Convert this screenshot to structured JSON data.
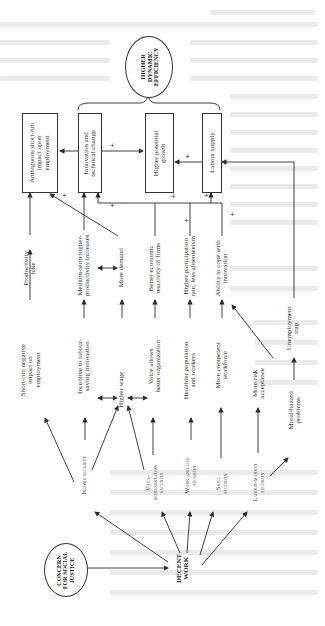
{
  "page": {
    "orientation": "rotated-90-ccw",
    "background": "#ffffff",
    "ink": "#2a2a2a"
  },
  "diagram": {
    "title_ellipse": {
      "id": "higher-dynamic-efficiency",
      "lines": [
        "HIGHER",
        "DYNAMIC",
        "EFFICIENCY"
      ]
    },
    "source_ellipse": {
      "id": "concern-for-social-justice",
      "lines": [
        "CONCERN",
        "FOR SOCIAL",
        "JUSTICE"
      ]
    },
    "hub": {
      "id": "decent-work",
      "lines": [
        "DECENT",
        "WORK"
      ]
    },
    "outcome_boxes": [
      {
        "id": "ambiguous",
        "lines": [
          "Ambiguous short-run",
          "impact upon",
          "employment"
        ]
      },
      {
        "id": "innovation",
        "lines": [
          "Innovation and",
          "technical change"
        ]
      },
      {
        "id": "growth",
        "lines": [
          "Higher potential",
          "growth"
        ]
      },
      {
        "id": "labour-supply",
        "lines": [
          "Labour supply"
        ]
      }
    ],
    "securities": [
      {
        "id": "income-security",
        "lines": [
          "Income security"
        ]
      },
      {
        "id": "voice-representation-security",
        "lines": [
          "Voice-",
          "representation",
          "security"
        ]
      },
      {
        "id": "work-life-security",
        "lines": [
          "Work and life",
          "security"
        ]
      },
      {
        "id": "skill-security",
        "lines": [
          "Skill",
          "security"
        ]
      },
      {
        "id": "labour-market-security",
        "lines": [
          "Labour-market",
          "security"
        ]
      }
    ],
    "first_effects": [
      {
        "id": "short-run-negative",
        "lines": [
          "Short-run negative",
          "impact on",
          "employment"
        ]
      },
      {
        "id": "incentive",
        "lines": [
          "Incentive to labour-",
          "saving innovation"
        ]
      },
      {
        "id": "higher-wage",
        "lines": [
          "Higher wage"
        ]
      },
      {
        "id": "voice-allows",
        "lines": [
          "Voice allows",
          "better organization"
        ]
      },
      {
        "id": "healthier",
        "lines": [
          "Healthier population",
          "and workers"
        ]
      },
      {
        "id": "more-competent",
        "lines": [
          "More competent",
          "workforce"
        ]
      },
      {
        "id": "more-risk",
        "lines": [
          "More risk",
          "acceptance"
        ]
      },
      {
        "id": "moral-hazard",
        "lines": [
          "Moral-hazard",
          "problems"
        ]
      }
    ],
    "second_effects": [
      {
        "id": "productivity-hike",
        "lines": [
          "Productivity",
          "hike"
        ]
      },
      {
        "id": "medium-term",
        "lines": [
          "Medium-term higher-",
          "productivity increases"
        ]
      },
      {
        "id": "more-demand",
        "lines": [
          "More demand"
        ]
      },
      {
        "id": "better-economic",
        "lines": [
          "Better economic",
          "reactivity of firms"
        ]
      },
      {
        "id": "higher-participation",
        "lines": [
          "Higher participation",
          "rate, less absenteeism"
        ]
      },
      {
        "id": "ability-cope",
        "lines": [
          "Ability to cope with",
          "innovation"
        ]
      },
      {
        "id": "unemployment-trap",
        "lines": [
          "Unemployment",
          "trap"
        ]
      }
    ],
    "sign_label": "+"
  }
}
